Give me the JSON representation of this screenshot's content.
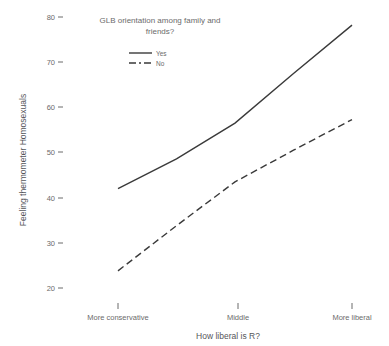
{
  "chart_data": {
    "type": "line",
    "title": "",
    "xlabel": "How liberal is R?",
    "ylabel": "Feeling thermometer Homosexuals",
    "categories": [
      "More conservative",
      "Middle",
      "More liberal"
    ],
    "x": [
      1,
      2,
      3
    ],
    "xlim": [
      0.72,
      3.28
    ],
    "ylim": [
      17.5,
      81.5
    ],
    "yticks": [
      20,
      30,
      40,
      50,
      60,
      70,
      80
    ],
    "ytick_labels": [
      "20",
      "30",
      "40",
      "50",
      "60",
      "70",
      "80"
    ],
    "grid": false,
    "legend_position": "top-center-inside",
    "legend_title": "GLB orientation among family and friends?",
    "series": [
      {
        "name": "Yes",
        "style": "solid",
        "color": "#3a3a3a",
        "values": [
          42.0,
          56.5,
          78.2
        ],
        "points": [
          {
            "x": 1.0,
            "y": 42.0
          },
          {
            "x": 1.5,
            "y": 48.6
          },
          {
            "x": 2.0,
            "y": 56.5
          },
          {
            "x": 2.5,
            "y": 67.5
          },
          {
            "x": 3.0,
            "y": 78.2
          }
        ]
      },
      {
        "name": "No",
        "style": "dashed",
        "color": "#3a3a3a",
        "values": [
          23.8,
          43.5,
          57.3
        ],
        "points": [
          {
            "x": 1.0,
            "y": 23.8
          },
          {
            "x": 1.5,
            "y": 33.8
          },
          {
            "x": 2.0,
            "y": 43.5
          },
          {
            "x": 2.5,
            "y": 50.5
          },
          {
            "x": 3.0,
            "y": 57.3
          }
        ]
      }
    ]
  },
  "axis": {
    "y_title": "Feeling thermometer Homosexuals",
    "x_title": "How liberal is R?",
    "y_tick_labels": [
      "80",
      "70",
      "60",
      "50",
      "40",
      "30",
      "20"
    ],
    "x_tick_labels": [
      "More conservative",
      "Middle",
      "More liberal"
    ]
  },
  "legend": {
    "title_line1": "GLB orientation among family and",
    "title_line2": "friends?",
    "items": [
      {
        "label": "Yes",
        "style": "solid"
      },
      {
        "label": "No",
        "style": "dashed"
      }
    ]
  }
}
